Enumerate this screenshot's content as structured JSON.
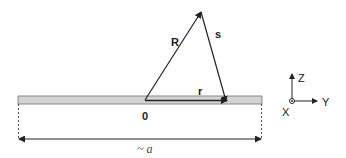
{
  "diagram": {
    "vectors": {
      "R_label": "R",
      "s_label": "s",
      "r_label": "r"
    },
    "origin_label": "0",
    "width_label": "~ a",
    "axes": {
      "z_label": "Z",
      "y_label": "Y",
      "x_label": "X"
    },
    "colors": {
      "strip_fill": "#d3d3d3",
      "strip_edge": "#8a8a8a",
      "line": "#222222"
    }
  }
}
